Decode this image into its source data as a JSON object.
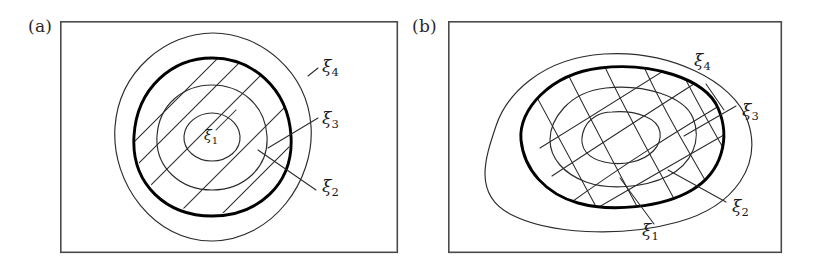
{
  "figure": {
    "background_color": "#ffffff",
    "stroke_color": "#2b2b2b",
    "bold_stroke_color": "#000000",
    "frame_color": "#4a4a4a",
    "width": 818,
    "height": 274
  },
  "panels": [
    {
      "id": "a",
      "tag": "(a)",
      "description": "Four concentric circular contours with an oblique straight mesh overlay; the second-outermost contour is emphasized in bold.",
      "frame": {
        "x": 60,
        "y": 21,
        "width": 338,
        "height": 232
      },
      "contour_count": 4,
      "bold_contour_index": 2,
      "labels": [
        {
          "name": "xi4",
          "symbol": "ξ",
          "subscript": "4",
          "text": "ξ4",
          "x": 324,
          "y": 66,
          "placement": "outside-right",
          "leader": true
        },
        {
          "name": "xi3",
          "symbol": "ξ",
          "subscript": "3",
          "text": "ξ3",
          "x": 324,
          "y": 118,
          "placement": "outside-right",
          "leader": true
        },
        {
          "name": "xi2",
          "symbol": "ξ",
          "subscript": "2",
          "text": "ξ2",
          "x": 324,
          "y": 186,
          "placement": "outside-right",
          "leader": true
        },
        {
          "name": "xi1",
          "symbol": "ξ",
          "subscript": "1",
          "text": "ξ1",
          "x": 210,
          "y": 136,
          "placement": "center-inside",
          "leader": false
        }
      ]
    },
    {
      "id": "b",
      "tag": "(b)",
      "description": "Four nested irregular closed contours with a curvilinear crossing mesh; the second-outermost contour is emphasized in bold.",
      "frame": {
        "x": 448,
        "y": 21,
        "width": 334,
        "height": 232
      },
      "contour_count": 4,
      "bold_contour_index": 2,
      "labels": [
        {
          "name": "xi4",
          "symbol": "ξ",
          "subscript": "4",
          "text": "ξ4",
          "x": 692,
          "y": 62,
          "placement": "outside-upper-right",
          "leader": true
        },
        {
          "name": "xi3",
          "symbol": "ξ",
          "subscript": "3",
          "text": "ξ3",
          "x": 740,
          "y": 110,
          "placement": "outside-right",
          "leader": true
        },
        {
          "name": "xi2",
          "symbol": "ξ",
          "subscript": "2",
          "text": "ξ2",
          "x": 730,
          "y": 206,
          "placement": "outside-lower-right",
          "leader": true
        },
        {
          "name": "xi1",
          "symbol": "ξ",
          "subscript": "1",
          "text": "ξ1",
          "x": 640,
          "y": 228,
          "placement": "outside-below",
          "leader": true
        }
      ]
    }
  ],
  "chart_data": {
    "type": "line",
    "xlabel": "",
    "ylabel": "",
    "legend_position": "inline-leader-labels",
    "grid": false,
    "series": [
      {
        "name": "ξ1",
        "panel": "a",
        "shape": "circle",
        "relative_radius": 0.22,
        "emphasis": "normal"
      },
      {
        "name": "ξ2",
        "panel": "a",
        "shape": "circle",
        "relative_radius": 0.47,
        "emphasis": "normal"
      },
      {
        "name": "ξ3",
        "panel": "a",
        "shape": "circle",
        "relative_radius": 0.74,
        "emphasis": "bold"
      },
      {
        "name": "ξ4",
        "panel": "a",
        "shape": "circle",
        "relative_radius": 1.0,
        "emphasis": "normal"
      },
      {
        "name": "ξ1",
        "panel": "b",
        "shape": "irregular-closed",
        "relative_radius": 0.22,
        "emphasis": "normal"
      },
      {
        "name": "ξ2",
        "panel": "b",
        "shape": "irregular-closed",
        "relative_radius": 0.48,
        "emphasis": "normal"
      },
      {
        "name": "ξ3",
        "panel": "b",
        "shape": "irregular-closed",
        "relative_radius": 0.75,
        "emphasis": "bold"
      },
      {
        "name": "ξ4",
        "panel": "b",
        "shape": "irregular-closed",
        "relative_radius": 1.0,
        "emphasis": "normal"
      }
    ],
    "annotations": [
      "(a)",
      "(b)",
      "ξ1",
      "ξ2",
      "ξ3",
      "ξ4"
    ]
  }
}
